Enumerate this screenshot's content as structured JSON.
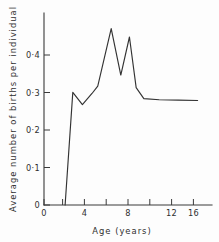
{
  "chart_data": {
    "type": "line",
    "title": "",
    "subtitle": "",
    "xlabel": "Age (years)",
    "ylabel": "Average number of births per individual",
    "xlim": [
      0,
      17.5
    ],
    "ylim": [
      0,
      0.52
    ],
    "grid": false,
    "legend": null,
    "legend_position": "none",
    "xticks": [
      0,
      4,
      8,
      12,
      16
    ],
    "xtick_labels": [
      "0",
      "4",
      "8",
      "12",
      "16"
    ],
    "yticks": [
      0,
      0.1,
      0.2,
      0.3,
      0.4
    ],
    "ytick_labels": [
      "0",
      "0·1",
      "0·2",
      "0·3",
      "0·4"
    ],
    "series": [
      {
        "name": "Average births per individual",
        "color": "#333333",
        "x": [
          2.2,
          3.0,
          4.0,
          5.0,
          5.6,
          7.0,
          8.0,
          8.9,
          9.6,
          10.4,
          12.0,
          14.0,
          16.0
        ],
        "y": [
          0.0,
          0.305,
          0.272,
          0.302,
          0.322,
          0.478,
          0.352,
          0.455,
          0.318,
          0.288,
          0.285,
          0.284,
          0.283
        ]
      }
    ],
    "annotations": []
  },
  "axis_labels": {
    "x_title": "Age (years)",
    "y_title": "Average number of births per individual"
  }
}
